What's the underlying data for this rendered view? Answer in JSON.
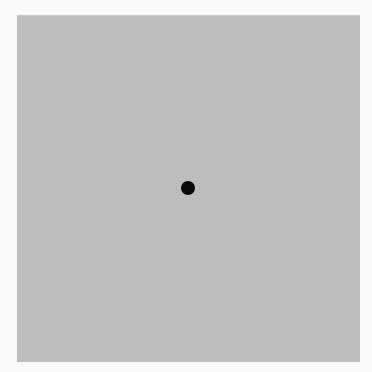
{
  "stimulus": {
    "background_color": "#fafafa",
    "field_color": "#bdbdbd",
    "dot_color": "#0a0a0a",
    "dot_shape": "circle",
    "dot_position": "center"
  }
}
